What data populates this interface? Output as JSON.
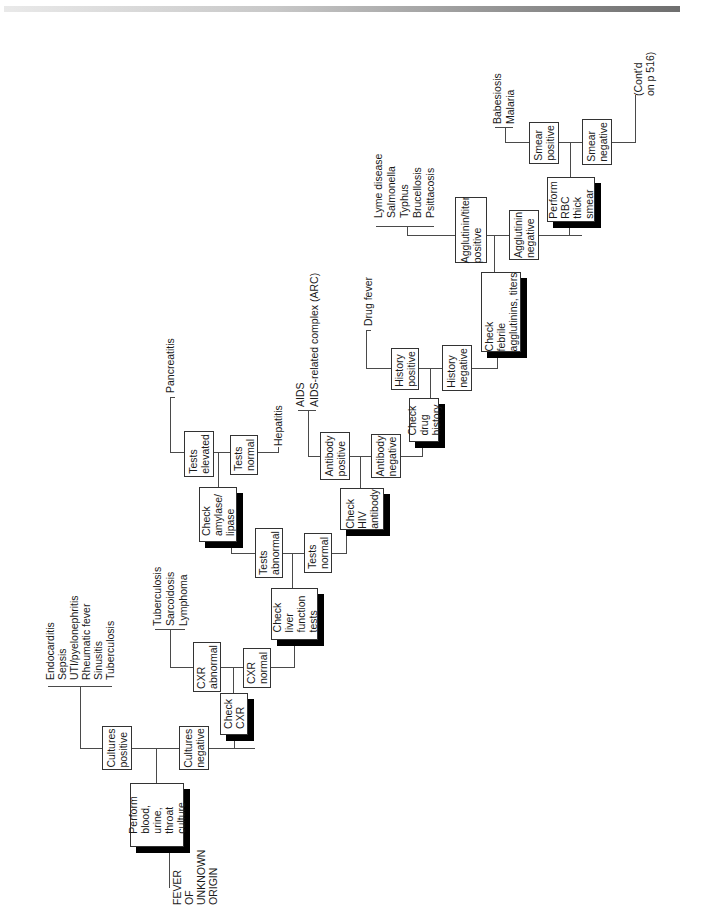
{
  "diagram": {
    "start": "FEVER\nOF\nUNKNOWN\nORIGIN",
    "continuation": "(Cont'd\non p 516)",
    "nodes": {
      "perform_culture": "Perform\nblood,\nurine,\nthroat\nculture",
      "cultures_positive": "Cultures\npositive",
      "cultures_negative": "Cultures\nnegative",
      "check_cxr": "Check\nCXR",
      "cxr_abnormal": "CXR\nabnormal",
      "cxr_normal": "CXR\nnormal",
      "check_lft": "Check\nliver\nfunction\ntests",
      "tests_abnormal": "Tests\nabnormal",
      "tests_normal_lft": "Tests\nnormal",
      "check_amylase": "Check\namylase/\nlipase",
      "tests_elevated": "Tests\nelevated",
      "tests_normal_amylase": "Tests\nnormal",
      "check_hiv": "Check\nHIV\nantibody",
      "antibody_positive": "Antibody\npositive",
      "antibody_negative": "Antibody\nnegative",
      "check_drug": "Check\ndrug\nhistory",
      "history_positive": "History\npositive",
      "history_negative": "History\nnegative",
      "check_febrile": "Check\nfebrile\nagglutinins, titers",
      "agglutinin_positive": "Agglutinin/titer\npositive",
      "agglutinin_negative": "Agglutinin\nnegative",
      "perform_rbc": "Perform\nRBC\nthick\nsmear",
      "smear_positive": "Smear\npositive",
      "smear_negative": "Smear\nnegative"
    },
    "outcomes": {
      "cultures_positive": [
        "Endocarditis",
        "Sepsis",
        "UTI/pyelonephritis",
        "Rheumatic fever",
        "Sinusitis",
        "Tuberculosis"
      ],
      "cxr_abnormal": [
        "Tuberculosis",
        "Sarcoidosis",
        "Lymphoma"
      ],
      "tests_elevated": [
        "Pancreatitis"
      ],
      "tests_normal_amylase": [
        "Hepatitis"
      ],
      "antibody_positive": [
        "AIDS",
        "AIDS-related complex (ARC)"
      ],
      "history_positive": [
        "Drug fever"
      ],
      "agglutinin_positive": [
        "Lyme disease",
        "Salmonella",
        "Typhus",
        "Brucellosis",
        "Psittacosis"
      ],
      "smear_positive": [
        "Babesiosis",
        "Malaria"
      ]
    }
  }
}
